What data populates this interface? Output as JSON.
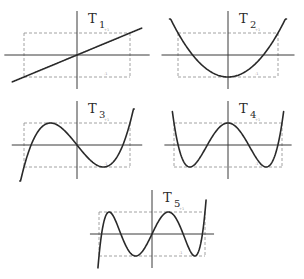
{
  "panels": [
    {
      "id": "T1",
      "label": "T",
      "subscript": "1",
      "cx": 77,
      "cy": 55,
      "halfw": 53,
      "halfh": 22,
      "xmin": -1.22,
      "xmax": 1.22
    },
    {
      "id": "T2",
      "label": "T",
      "subscript": "2",
      "cx": 228,
      "cy": 55,
      "halfw": 50,
      "halfh": 22,
      "xmin": -1.17,
      "xmax": 1.17
    },
    {
      "id": "T3",
      "label": "T",
      "subscript": "3",
      "cx": 77,
      "cy": 145,
      "halfw": 53,
      "halfh": 22,
      "xmin": -1.08,
      "xmax": 1.08
    },
    {
      "id": "T4",
      "label": "T",
      "subscript": "4",
      "cx": 228,
      "cy": 145,
      "halfw": 54,
      "halfh": 22,
      "xmin": -1.03,
      "xmax": 1.03
    },
    {
      "id": "T5",
      "label": "T",
      "subscript": "5",
      "cx": 152,
      "cy": 234,
      "halfw": 53,
      "halfh": 22,
      "xmin": -1.02,
      "xmax": 1.02
    }
  ],
  "chart_data": [
    {
      "type": "line",
      "title": "T1",
      "formula": "x",
      "x": [
        -1,
        -0.5,
        0,
        0.5,
        1
      ],
      "values": [
        -1,
        -0.5,
        0,
        0.5,
        1
      ],
      "ylim": [
        -1,
        1
      ],
      "xlim": [
        -1,
        1
      ],
      "grid": false,
      "annotations": [
        "+1",
        "-1"
      ]
    },
    {
      "type": "line",
      "title": "T2",
      "formula": "2x^2 - 1",
      "x": [
        -1,
        -0.5,
        0,
        0.5,
        1
      ],
      "values": [
        1,
        -0.5,
        -1,
        -0.5,
        1
      ],
      "ylim": [
        -1,
        1
      ],
      "xlim": [
        -1,
        1
      ],
      "grid": false,
      "annotations": [
        "+1",
        "-1"
      ]
    },
    {
      "type": "line",
      "title": "T3",
      "formula": "4x^3 - 3x",
      "x": [
        -1,
        -0.5,
        0,
        0.5,
        1
      ],
      "values": [
        -1,
        1,
        0,
        -1,
        1
      ],
      "ylim": [
        -1,
        1
      ],
      "xlim": [
        -1,
        1
      ],
      "grid": false,
      "annotations": [
        "+1",
        "-1"
      ]
    },
    {
      "type": "line",
      "title": "T4",
      "formula": "8x^4 - 8x^2 + 1",
      "x": [
        -1,
        -0.707,
        0,
        0.707,
        1
      ],
      "values": [
        1,
        -1,
        1,
        -1,
        1
      ],
      "ylim": [
        -1,
        1
      ],
      "xlim": [
        -1,
        1
      ],
      "grid": false,
      "annotations": [
        "+1",
        "-1"
      ]
    },
    {
      "type": "line",
      "title": "T5",
      "formula": "16x^5 - 20x^3 + 5x",
      "x": [
        -1,
        -0.809,
        -0.309,
        0,
        0.309,
        0.809,
        1
      ],
      "values": [
        -1,
        1,
        -1,
        0,
        1,
        -1,
        1
      ],
      "ylim": [
        -1,
        1
      ],
      "xlim": [
        -1,
        1
      ],
      "grid": false,
      "annotations": [
        "+1",
        "-1"
      ]
    }
  ]
}
